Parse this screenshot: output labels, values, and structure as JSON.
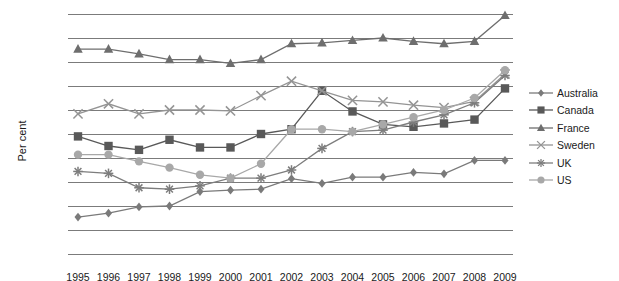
{
  "chart_data": {
    "type": "line",
    "title": "",
    "xlabel": "",
    "ylabel": "Per cent",
    "ylim": [
      4.5,
      9.5
    ],
    "ytick_step": 0.5,
    "grid": true,
    "legend_position": "right",
    "yticks": [
      "9.5",
      "9.0",
      "8.5",
      "8.0",
      "7.5",
      "7.0",
      "6.5",
      "6.0",
      "5.5",
      "5.0",
      "4.5"
    ],
    "categories": [
      1995,
      1996,
      1997,
      1998,
      1999,
      2000,
      2001,
      2002,
      2003,
      2004,
      2005,
      2006,
      2007,
      2008,
      2009
    ],
    "xtick_labels": [
      "1995",
      "1996",
      "1997",
      "1998",
      "1999",
      "2000",
      "2001",
      "2002",
      "2003",
      "2004",
      "2005",
      "2006",
      "2007",
      "2008",
      "2009"
    ],
    "series": [
      {
        "name": "Australia",
        "marker": "diamond",
        "color": "#7a7a7a",
        "values": [
          5.27,
          5.35,
          5.48,
          5.5,
          5.8,
          5.83,
          5.85,
          6.07,
          5.97,
          6.1,
          6.1,
          6.2,
          6.17,
          6.45,
          6.45
        ]
      },
      {
        "name": "Canada",
        "marker": "square",
        "color": "#595959",
        "values": [
          6.95,
          6.75,
          6.67,
          6.88,
          6.72,
          6.72,
          7.0,
          7.1,
          7.9,
          7.47,
          7.2,
          7.15,
          7.22,
          7.3,
          7.95
        ]
      },
      {
        "name": "France",
        "marker": "triangle",
        "color": "#6e6e6e",
        "values": [
          8.77,
          8.77,
          8.67,
          8.55,
          8.55,
          8.47,
          8.55,
          8.88,
          8.9,
          8.95,
          9.0,
          8.93,
          8.88,
          8.93,
          9.47
        ]
      },
      {
        "name": "Sweden",
        "marker": "x",
        "color": "#949494",
        "values": [
          7.42,
          7.63,
          7.42,
          7.5,
          7.5,
          7.48,
          7.8,
          8.1,
          7.9,
          7.7,
          7.67,
          7.6,
          7.55,
          7.68,
          8.25
        ]
      },
      {
        "name": "UK",
        "marker": "star",
        "color": "#7d7d7d",
        "values": [
          6.22,
          6.18,
          5.88,
          5.85,
          5.92,
          6.08,
          6.08,
          6.25,
          6.7,
          7.05,
          7.08,
          7.25,
          7.4,
          7.65,
          8.22
        ]
      },
      {
        "name": "US",
        "marker": "circle",
        "color": "#a8a8a8",
        "values": [
          6.57,
          6.57,
          6.43,
          6.3,
          6.15,
          6.08,
          6.38,
          7.1,
          7.1,
          7.05,
          7.2,
          7.35,
          7.5,
          7.75,
          8.33
        ]
      }
    ]
  },
  "legend": {
    "items": [
      {
        "label": "Australia"
      },
      {
        "label": "Canada"
      },
      {
        "label": "France"
      },
      {
        "label": "Sweden"
      },
      {
        "label": "UK"
      },
      {
        "label": "US"
      }
    ]
  }
}
